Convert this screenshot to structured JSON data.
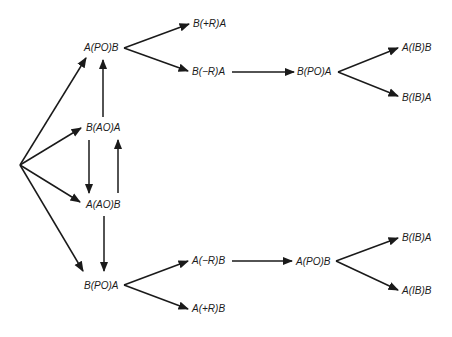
{
  "diagram": {
    "type": "state-transition-tree",
    "colors": {
      "line": "#1a1a1a",
      "background": "#ffffff"
    },
    "nodes": {
      "a_po_b_top": {
        "label": "A(PO)B"
      },
      "b_plus_r_a": {
        "label": "B(+R)A"
      },
      "b_minus_r_a": {
        "label": "B(−R)A"
      },
      "b_po_a_right": {
        "label": "B(PO)A"
      },
      "a_ib_b_top": {
        "label": "A(IB)B"
      },
      "b_ib_a_top": {
        "label": "B(IB)A"
      },
      "b_ao_a": {
        "label": "B(AO)A"
      },
      "a_ao_b": {
        "label": "A(AO)B"
      },
      "b_po_a_bottom": {
        "label": "B(PO)A"
      },
      "a_minus_r_b": {
        "label": "A(−R)B"
      },
      "a_plus_r_b": {
        "label": "A(+R)B"
      },
      "a_po_b_right": {
        "label": "A(PO)B"
      },
      "b_ib_a_bottom": {
        "label": "B(IB)A"
      },
      "a_ib_b_bottom": {
        "label": "A(IB)B"
      }
    },
    "edges": [
      {
        "from": "origin",
        "to": "a_po_b_top"
      },
      {
        "from": "origin",
        "to": "b_ao_a"
      },
      {
        "from": "origin",
        "to": "a_ao_b"
      },
      {
        "from": "origin",
        "to": "b_po_a_bottom"
      },
      {
        "from": "a_po_b_top",
        "to": "b_plus_r_a"
      },
      {
        "from": "a_po_b_top",
        "to": "b_minus_r_a"
      },
      {
        "from": "b_minus_r_a",
        "to": "b_po_a_right"
      },
      {
        "from": "b_po_a_right",
        "to": "a_ib_b_top"
      },
      {
        "from": "b_po_a_right",
        "to": "b_ib_a_top"
      },
      {
        "from": "b_ao_a",
        "to": "a_po_b_top"
      },
      {
        "from": "b_ao_a",
        "to": "a_ao_b"
      },
      {
        "from": "a_ao_b",
        "to": "b_ao_a"
      },
      {
        "from": "a_ao_b",
        "to": "b_po_a_bottom"
      },
      {
        "from": "b_po_a_bottom",
        "to": "a_minus_r_b"
      },
      {
        "from": "b_po_a_bottom",
        "to": "a_plus_r_b"
      },
      {
        "from": "a_minus_r_b",
        "to": "a_po_b_right"
      },
      {
        "from": "a_po_b_right",
        "to": "b_ib_a_bottom"
      },
      {
        "from": "a_po_b_right",
        "to": "a_ib_b_bottom"
      }
    ]
  }
}
